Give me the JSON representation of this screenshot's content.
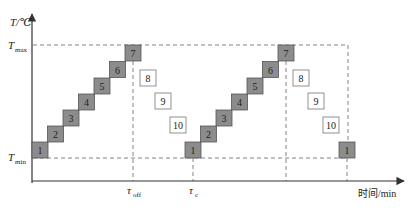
{
  "diagram": {
    "y_axis_label": "T/℃",
    "x_axis_label": "时间/min",
    "tmax_label": {
      "main": "T",
      "sub": "max"
    },
    "tmin_label": {
      "main": "T",
      "sub": "min"
    },
    "tau_off_label": {
      "main": "τ",
      "sub": "off"
    },
    "tau_c_label": {
      "main": "τ",
      "sub": "c"
    },
    "colors": {
      "heating_box_fill": "#8c8c8c",
      "heating_box_stroke": "#555555",
      "cooling_box_fill": "#ffffff",
      "cooling_box_stroke": "#777777",
      "axis": "#333333",
      "dashed": "#666666"
    },
    "cycle1": {
      "heating": [
        {
          "label": "1",
          "x": 32,
          "y": 142
        },
        {
          "label": "2",
          "x": 47.5,
          "y": 126
        },
        {
          "label": "3",
          "x": 63,
          "y": 110
        },
        {
          "label": "4",
          "x": 78.5,
          "y": 94
        },
        {
          "label": "5",
          "x": 94,
          "y": 78
        },
        {
          "label": "6",
          "x": 109.5,
          "y": 61.5
        },
        {
          "label": "7",
          "x": 125,
          "y": 45
        }
      ],
      "cooling": [
        {
          "label": "8",
          "x": 140,
          "y": 70
        },
        {
          "label": "9",
          "x": 155,
          "y": 93
        },
        {
          "label": "10",
          "x": 170,
          "y": 117
        }
      ]
    },
    "cycle2": {
      "heating": [
        {
          "label": "1",
          "x": 185,
          "y": 142
        },
        {
          "label": "2",
          "x": 200.5,
          "y": 126
        },
        {
          "label": "3",
          "x": 216,
          "y": 110
        },
        {
          "label": "4",
          "x": 231.5,
          "y": 94
        },
        {
          "label": "5",
          "x": 247,
          "y": 78
        },
        {
          "label": "6",
          "x": 262.5,
          "y": 61.5
        },
        {
          "label": "7",
          "x": 278,
          "y": 45
        }
      ],
      "cooling": [
        {
          "label": "8",
          "x": 293,
          "y": 70
        },
        {
          "label": "9",
          "x": 308,
          "y": 93
        },
        {
          "label": "10",
          "x": 323,
          "y": 117
        }
      ]
    },
    "cycle3": {
      "heating": [
        {
          "label": "1",
          "x": 339,
          "y": 142
        }
      ]
    }
  }
}
